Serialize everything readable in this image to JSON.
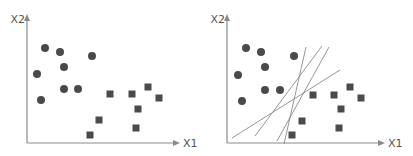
{
  "colors": {
    "axis": "#8a8a8a",
    "point": "#4a4a4a",
    "line": "#8a8a8a",
    "label": "#555555"
  },
  "panels": [
    {
      "name": "left",
      "x_label": "X1",
      "y_label": "X2",
      "origin": [
        27,
        143
      ],
      "x_axis_end": 180,
      "y_axis_top": 14,
      "circles": [
        [
          45,
          48
        ],
        [
          60,
          52
        ],
        [
          92,
          56
        ],
        [
          64,
          67
        ],
        [
          37,
          74
        ],
        [
          64,
          89
        ],
        [
          78,
          89
        ],
        [
          41,
          100
        ]
      ],
      "squares": [
        [
          110,
          94
        ],
        [
          132,
          94
        ],
        [
          148,
          87
        ],
        [
          159,
          98
        ],
        [
          138,
          109
        ],
        [
          99,
          120
        ],
        [
          136,
          128
        ],
        [
          90,
          135
        ]
      ],
      "lines": []
    },
    {
      "name": "right",
      "x_label": "X1",
      "y_label": "X2",
      "origin": [
        227,
        143
      ],
      "x_axis_end": 385,
      "y_axis_top": 14,
      "circles": [
        [
          246,
          48
        ],
        [
          261,
          52
        ],
        [
          294,
          56
        ],
        [
          265,
          67
        ],
        [
          238,
          75
        ],
        [
          265,
          90
        ],
        [
          280,
          90
        ],
        [
          242,
          101
        ]
      ],
      "squares": [
        [
          313,
          95
        ],
        [
          334,
          95
        ],
        [
          350,
          87
        ],
        [
          361,
          98
        ],
        [
          341,
          109
        ],
        [
          302,
          121
        ],
        [
          339,
          128
        ],
        [
          292,
          135
        ]
      ],
      "lines": [
        [
          [
            232,
            138
          ],
          [
            340,
            70
          ]
        ],
        [
          [
            255,
            136
          ],
          [
            322,
            46
          ]
        ],
        [
          [
            277,
            141
          ],
          [
            329,
            47
          ]
        ],
        [
          [
            284,
            144
          ],
          [
            306,
            47
          ]
        ]
      ]
    }
  ]
}
